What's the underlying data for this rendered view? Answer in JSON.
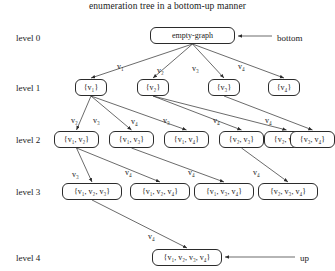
{
  "title": "enumeration tree in a bottom-up manner",
  "levels": [
    {
      "label": "level 0",
      "x": 16,
      "y": 33
    },
    {
      "label": "level 1",
      "x": 16,
      "y": 83
    },
    {
      "label": "level 2",
      "x": 16,
      "y": 135
    },
    {
      "label": "level 3",
      "x": 16,
      "y": 187
    },
    {
      "label": "level 4",
      "x": 16,
      "y": 253
    }
  ],
  "annotations": [
    {
      "name": "bottom-annotation",
      "text": "bottom",
      "x": 277,
      "y": 33
    },
    {
      "name": "up-annotation",
      "text": "up",
      "x": 300,
      "y": 253
    }
  ],
  "nodes": [
    {
      "id": "root",
      "text": "empty-graph",
      "x": 150,
      "y": 27,
      "w": 85,
      "level": 0
    },
    {
      "id": "v1",
      "text": "{v₁}",
      "x": 75,
      "y": 79,
      "w": 32,
      "level": 1
    },
    {
      "id": "v2",
      "text": "{v₂}",
      "x": 137,
      "y": 79,
      "w": 32,
      "level": 1
    },
    {
      "id": "v3",
      "text": "{v₃}",
      "x": 208,
      "y": 79,
      "w": 32,
      "level": 1
    },
    {
      "id": "v4",
      "text": "{v₄}",
      "x": 268,
      "y": 79,
      "w": 32,
      "level": 1
    },
    {
      "id": "v12",
      "text": "{v₁, v₂}",
      "x": 54,
      "y": 131,
      "w": 45,
      "level": 2
    },
    {
      "id": "v13",
      "text": "{v₁, v₃}",
      "x": 109,
      "y": 131,
      "w": 45,
      "level": 2
    },
    {
      "id": "v14",
      "text": "{v₁, v₄}",
      "x": 164,
      "y": 131,
      "w": 45,
      "level": 2
    },
    {
      "id": "v23",
      "text": "{v₂, v₃}",
      "x": 219,
      "y": 131,
      "w": 45,
      "level": 2
    },
    {
      "id": "v24",
      "text": "{v₂, v₄}",
      "x": 264,
      "y": 131,
      "w": 45,
      "level": 2
    },
    {
      "id": "v34",
      "text": "{v₃, v₄}",
      "x": 290,
      "y": 131,
      "w": 45,
      "level": 2
    },
    {
      "id": "v123",
      "text": "{v₁, v₂, v₃}",
      "x": 62,
      "y": 183,
      "w": 60,
      "level": 3
    },
    {
      "id": "v124",
      "text": "{v₁, v₂, v₄}",
      "x": 130,
      "y": 183,
      "w": 60,
      "level": 3
    },
    {
      "id": "v134",
      "text": "{v₁, v₃, v₄}",
      "x": 194,
      "y": 183,
      "w": 60,
      "level": 3
    },
    {
      "id": "v234",
      "text": "{v₂, v₃, v₄}",
      "x": 258,
      "y": 183,
      "w": 60,
      "level": 3
    },
    {
      "id": "v1234",
      "text": "{v₁, v₂, v₃, v₄}",
      "x": 152,
      "y": 249,
      "w": 70,
      "level": 4
    }
  ],
  "edges": [
    {
      "from": "root",
      "to": "v1",
      "label": "v₁",
      "lx": 117,
      "ly": 62
    },
    {
      "from": "root",
      "to": "v2",
      "label": "v₂",
      "lx": 157,
      "ly": 66
    },
    {
      "from": "root",
      "to": "v3",
      "label": "v₃",
      "lx": 192,
      "ly": 64
    },
    {
      "from": "root",
      "to": "v4",
      "label": "v₄",
      "lx": 238,
      "ly": 62
    },
    {
      "from": "v1",
      "to": "v12",
      "label": "v₂",
      "lx": 71,
      "ly": 116
    },
    {
      "from": "v1",
      "to": "v13",
      "label": "v₃",
      "lx": 93,
      "ly": 116
    },
    {
      "from": "v1",
      "to": "v14",
      "label": "v₄",
      "lx": 131,
      "ly": 117
    },
    {
      "from": "v2",
      "to": "v23",
      "label": "v₃",
      "lx": 163,
      "ly": 116
    },
    {
      "from": "v2",
      "to": "v24",
      "label": "v₄",
      "lx": 213,
      "ly": 116
    },
    {
      "from": "v3",
      "to": "v34",
      "label": "v₄",
      "lx": 265,
      "ly": 116
    },
    {
      "from": "v12",
      "to": "v123",
      "label": "v₃",
      "lx": 72,
      "ly": 170
    },
    {
      "from": "v12",
      "to": "v124",
      "label": "v₄",
      "lx": 125,
      "ly": 168
    },
    {
      "from": "v13",
      "to": "v134",
      "label": "v₄",
      "lx": 188,
      "ly": 168
    },
    {
      "from": "v23",
      "to": "v234",
      "label": "v₄",
      "lx": 253,
      "ly": 168
    },
    {
      "from": "v123",
      "to": "v1234",
      "label": "v₄",
      "lx": 148,
      "ly": 232
    }
  ],
  "arrow_annotations": [
    {
      "name": "bottom-arrow",
      "x1": 272,
      "y1": 36,
      "x2": 238,
      "y2": 36
    },
    {
      "name": "up-arrow",
      "x1": 295,
      "y1": 257,
      "x2": 225,
      "y2": 257
    }
  ],
  "colors": {
    "stroke": "#2b2b2b",
    "text": "#1a1a1a",
    "background": "#ffffff"
  }
}
